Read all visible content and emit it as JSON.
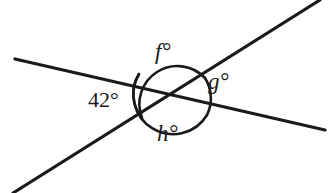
{
  "figure": {
    "kind": "geometry-diagram",
    "background_color": "#ffffff",
    "stroke_color": "#1a1a1a",
    "text_color": "#1a1a1a",
    "width": 335,
    "height": 193
  },
  "intersection": {
    "x": 172,
    "y": 95
  },
  "lines": [
    {
      "name": "shallow-line",
      "x1": 15,
      "y1": 59,
      "x2": 325,
      "y2": 130,
      "stroke_width": 3.2
    },
    {
      "name": "steep-line",
      "x1": 13,
      "y1": 193,
      "x2": 320,
      "y2": 0,
      "stroke_width": 3.2
    }
  ],
  "arcs": [
    {
      "name": "arc-42",
      "for_label": "42-degrees",
      "d": "M 139 74 A 38 38 0 0 0 142 118",
      "stroke_width": 2.6
    },
    {
      "name": "arc-f",
      "for_label": "f-degrees",
      "d": "M 142 118 A 38 38 0 0 1 205 78",
      "stroke_width": 2.6
    },
    {
      "name": "arc-g",
      "for_label": "g-degrees",
      "d": "M 205 78 A 38 38 0 0 1 207 115",
      "stroke_width": 2.6
    },
    {
      "name": "arc-h",
      "for_label": "h-degrees",
      "d": "M 207 115 A 38 38 0 0 1 139 74",
      "stroke_width": 2.6
    }
  ],
  "labels": {
    "left_angle": {
      "text": "42°",
      "x": 88,
      "y": 89,
      "style": "numeric",
      "name": "angle-label-42"
    },
    "top_angle": {
      "text": "f°",
      "x": 155,
      "y": 40,
      "style": "italic-var",
      "name": "angle-label-f"
    },
    "right_angle": {
      "text": "g°",
      "x": 208,
      "y": 70,
      "style": "italic-var",
      "name": "angle-label-g"
    },
    "bottom_angle": {
      "text": "h°",
      "x": 157,
      "y": 122,
      "style": "italic-var",
      "name": "angle-label-h"
    }
  }
}
